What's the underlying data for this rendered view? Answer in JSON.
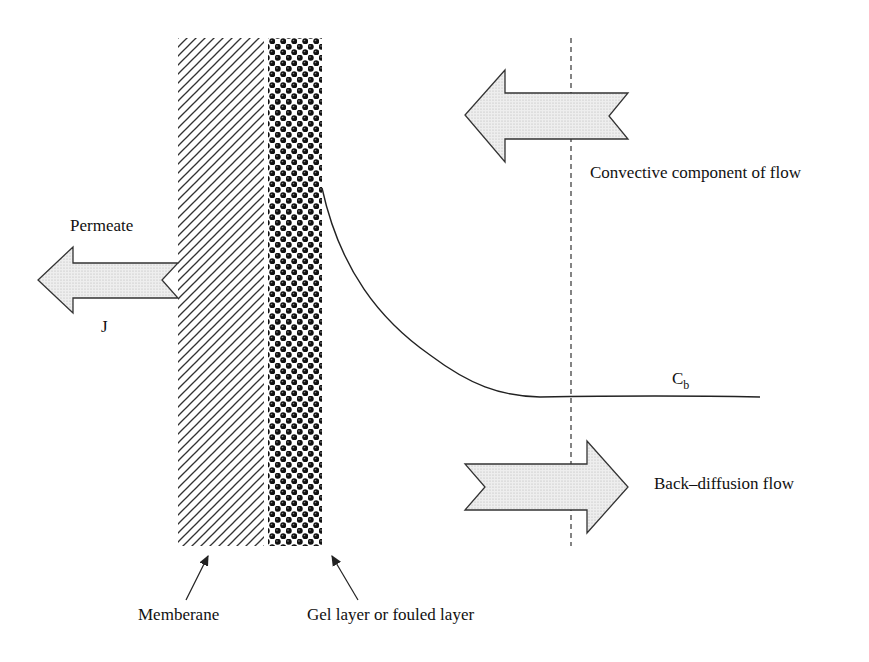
{
  "diagram": {
    "layers": {
      "membrane": {
        "label": "Memberane"
      },
      "gel": {
        "label": "Gel layer or fouled layer"
      }
    },
    "arrows": {
      "permeate": {
        "label": "Permeate",
        "flux_label": "J",
        "direction": "left"
      },
      "convective": {
        "label": "Convective component of flow",
        "direction": "left"
      },
      "back_diffusion": {
        "label": "Back–diffusion flow",
        "direction": "right"
      }
    },
    "curve": {
      "label_main": "C",
      "label_sub": "b"
    },
    "colors": {
      "line": "#222222",
      "arrow_fill": "#e4e4e4",
      "gel": "#111111"
    }
  }
}
